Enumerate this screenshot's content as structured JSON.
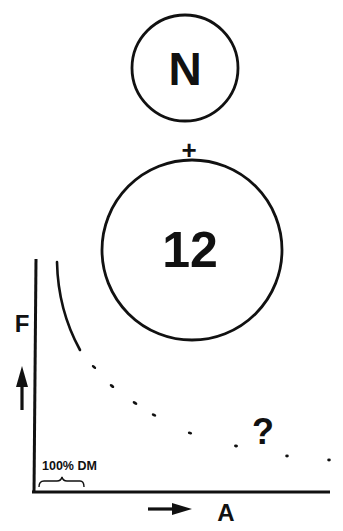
{
  "diagram": {
    "colors": {
      "ink": "#111111",
      "background": "#ffffff"
    },
    "top_circle": {
      "label": "N",
      "cx": 185,
      "cy": 68,
      "r": 53
    },
    "operator": "+",
    "bottom_circle": {
      "label": "12",
      "cx": 192,
      "cy": 250,
      "r": 90
    },
    "graph": {
      "y_axis_label": "F",
      "y_axis_arrow": "up-arrow",
      "x_axis_label": "A",
      "x_axis_arrow": "right-arrow",
      "reference_label": "100% DM",
      "unknown_marker": "?",
      "curve": {
        "solid_segment": "decreasing arc near y-axis",
        "dashed_segment": "dotted continuation trailing toward x-axis"
      }
    }
  }
}
